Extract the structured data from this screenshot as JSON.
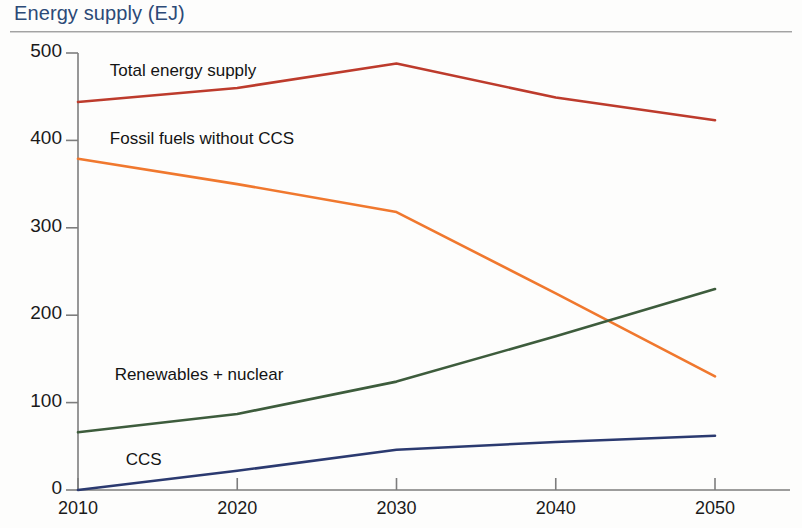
{
  "title": "Energy supply (EJ)",
  "chart_data": {
    "type": "line",
    "title": "Energy supply (EJ)",
    "xlabel": "",
    "ylabel": "Energy supply (EJ)",
    "x": [
      2010,
      2020,
      2030,
      2040,
      2050
    ],
    "xticklabels": [
      "2010",
      "2020",
      "2030",
      "2040",
      "2050"
    ],
    "yticklabels": [
      "0",
      "100",
      "200",
      "300",
      "400",
      "500"
    ],
    "yticks": [
      0,
      100,
      200,
      300,
      400,
      500
    ],
    "xlim": [
      2010,
      2050
    ],
    "ylim": [
      0,
      500
    ],
    "grid": false,
    "legend_position": "inline-labels",
    "series": [
      {
        "name": "Total energy supply",
        "color": "#bd3b2c",
        "values": [
          444,
          460,
          488,
          449,
          423
        ],
        "label_x": 2012.0,
        "label_y": 478
      },
      {
        "name": "Fossil fuels without CCS",
        "color": "#f0782e",
        "values": [
          379,
          350,
          318,
          225,
          130
        ],
        "label_x": 2012.0,
        "label_y": 400
      },
      {
        "name": "Renewables + nuclear",
        "color": "#3d5c3c",
        "values": [
          66,
          87,
          124,
          176,
          230
        ],
        "label_x": 2012.3,
        "label_y": 130
      },
      {
        "name": "CCS",
        "color": "#2b3a70",
        "values": [
          0,
          22,
          46,
          55,
          62
        ],
        "label_x": 2013.0,
        "label_y": 33
      }
    ]
  }
}
